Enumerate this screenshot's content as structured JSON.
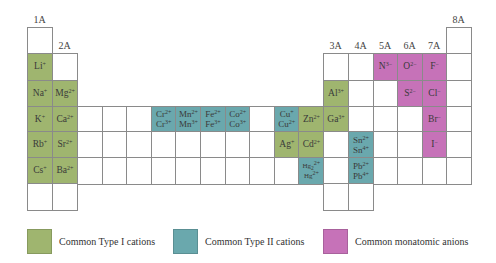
{
  "colors": {
    "type1": "#9fb56f",
    "type2": "#6aa8ad",
    "anion": "#c672b8"
  },
  "group_labels": [
    "1A",
    "2A",
    "3A",
    "4A",
    "5A",
    "6A",
    "7A",
    "8A"
  ],
  "ions": {
    "Li": [
      "Li^+"
    ],
    "Na": [
      "Na^+"
    ],
    "K": [
      "K^+"
    ],
    "Rb": [
      "Rb^+"
    ],
    "Cs": [
      "Cs^+"
    ],
    "Mg": [
      "Mg^2+"
    ],
    "Ca": [
      "Ca^2+"
    ],
    "Sr": [
      "Sr^2+"
    ],
    "Ba": [
      "Ba^2+"
    ],
    "Cr": [
      "Cr^2+",
      "Cr^3+"
    ],
    "Mn": [
      "Mn^2+",
      "Mn^3+"
    ],
    "Fe": [
      "Fe^2+",
      "Fe^3+"
    ],
    "Co": [
      "Co^2+",
      "Co^3+"
    ],
    "Cu": [
      "Cu^+",
      "Cu^2+"
    ],
    "Zn": [
      "Zn^2+"
    ],
    "Ag": [
      "Ag^+"
    ],
    "Cd": [
      "Cd^2+"
    ],
    "Hg": [
      "Hg_2^2+",
      "Hg^2+"
    ],
    "Al": [
      "Al^3+"
    ],
    "Ga": [
      "Ga^3+"
    ],
    "Sn": [
      "Sn^2+",
      "Sn^4+"
    ],
    "Pb": [
      "Pb^2+",
      "Pb^4+"
    ],
    "N": [
      "N^3−"
    ],
    "O": [
      "O^2−"
    ],
    "F": [
      "F^−"
    ],
    "S": [
      "S^2−"
    ],
    "Cl": [
      "Cl^−"
    ],
    "Br": [
      "Br^−"
    ],
    "I": [
      "I^−"
    ]
  },
  "legend": [
    {
      "label": "Common Type I cations",
      "type": "type1"
    },
    {
      "label": "Common Type II cations",
      "type": "type2"
    },
    {
      "label": "Common monatomic anions",
      "type": "anion"
    }
  ]
}
